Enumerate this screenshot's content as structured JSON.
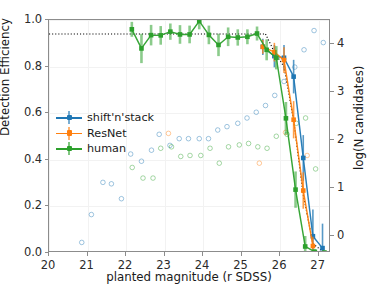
{
  "chart_data": {
    "type": "line",
    "title": "",
    "xlabel": "planted magnitude (r SDSS)",
    "ylabel": "Detection Efficiency",
    "y2label": "log(N candidates)",
    "xlim": [
      20,
      27.32
    ],
    "ylim": [
      0.0,
      1.0
    ],
    "y2lim": [
      -0.35,
      4.5
    ],
    "xticks": [
      20,
      21,
      22,
      23,
      24,
      25,
      26,
      27
    ],
    "xticklabels": [
      "20",
      "21",
      "22",
      "23",
      "24",
      "25",
      "26",
      "27"
    ],
    "yticks": [
      0.0,
      0.2,
      0.4,
      0.6,
      0.8,
      1.0
    ],
    "yticklabels": [
      "0.0",
      "0.2",
      "0.4",
      "0.6",
      "0.8",
      "1.0"
    ],
    "y2ticks": [
      0,
      1,
      2,
      3,
      4
    ],
    "y2ticklabels": [
      "0",
      "1",
      "2",
      "3",
      "4"
    ],
    "grid": true,
    "legend_position": "center-left",
    "reference_line": {
      "label": "max efficiency",
      "value": 0.94,
      "style": "dotted",
      "color": "#000000"
    },
    "series": [
      {
        "name": "shift'n'stack",
        "color": "#1f77b4",
        "marker": "square",
        "x": [
          25.55,
          25.85,
          26.1,
          26.35,
          26.6,
          26.85,
          27.1
        ],
        "values": [
          0.885,
          0.845,
          0.838,
          0.757,
          0.408,
          0.072,
          0.021
        ],
        "yerr": [
          0.035,
          0.048,
          0.055,
          0.072,
          0.098,
          0.115,
          0.105
        ]
      },
      {
        "name": "ResNet",
        "color": "#ff7f0e",
        "marker": "square",
        "x": [
          25.55,
          25.85,
          26.1,
          26.35,
          26.6,
          26.85
        ],
        "values": [
          0.885,
          0.862,
          0.828,
          0.572,
          0.268,
          0.03
        ],
        "yerr": [
          0.03,
          0.04,
          0.055,
          0.08,
          0.078,
          0.04
        ]
      },
      {
        "name": "human",
        "color": "#2ca02c",
        "marker": "square",
        "x": [
          22.15,
          22.4,
          22.65,
          22.9,
          23.15,
          23.4,
          23.65,
          23.9,
          24.15,
          24.4,
          24.65,
          24.9,
          25.15,
          25.4,
          25.65,
          25.9,
          26.15,
          26.4,
          26.65,
          26.9,
          27.15
        ],
        "values": [
          0.96,
          0.878,
          0.935,
          0.934,
          0.95,
          0.938,
          0.938,
          0.995,
          0.936,
          0.893,
          0.928,
          0.925,
          0.928,
          0.942,
          0.872,
          0.838,
          0.578,
          0.272,
          0.028,
          0.005,
          0.002
        ],
        "yerr": [
          0.032,
          0.063,
          0.044,
          0.04,
          0.035,
          0.04,
          0.038,
          0.035,
          0.04,
          0.048,
          0.04,
          0.035,
          0.032,
          0.03,
          0.045,
          0.05,
          0.07,
          0.078,
          0.045,
          0.012,
          0.008
        ]
      }
    ],
    "candidate_counts": {
      "description": "log(N candidates) open markers (right axis)",
      "points": [
        {
          "x": 20.85,
          "y2": -0.13,
          "color": "#1f77b4"
        },
        {
          "x": 21.1,
          "y2": 0.45,
          "color": "#1f77b4"
        },
        {
          "x": 21.4,
          "y2": 1.12,
          "color": "#1f77b4"
        },
        {
          "x": 21.62,
          "y2": 1.09,
          "color": "#1f77b4"
        },
        {
          "x": 21.88,
          "y2": 0.78,
          "color": "#1f77b4"
        },
        {
          "x": 22.12,
          "y2": 1.71,
          "color": "#1f77b4"
        },
        {
          "x": 22.16,
          "y2": 1.43,
          "color": "#2ca02c"
        },
        {
          "x": 22.4,
          "y2": 1.56,
          "color": "#1f77b4"
        },
        {
          "x": 22.44,
          "y2": 1.21,
          "color": "#2ca02c"
        },
        {
          "x": 22.66,
          "y2": 1.79,
          "color": "#1f77b4"
        },
        {
          "x": 22.7,
          "y2": 1.21,
          "color": "#2ca02c"
        },
        {
          "x": 22.86,
          "y2": 2.12,
          "color": "#1f77b4"
        },
        {
          "x": 22.9,
          "y2": 1.83,
          "color": "#2ca02c"
        },
        {
          "x": 23.1,
          "y2": 2.14,
          "color": "#ff7f0e"
        },
        {
          "x": 23.14,
          "y2": 1.89,
          "color": "#1f77b4"
        },
        {
          "x": 23.18,
          "y2": 1.86,
          "color": "#2ca02c"
        },
        {
          "x": 23.38,
          "y2": 2.03,
          "color": "#1f77b4"
        },
        {
          "x": 23.42,
          "y2": 1.66,
          "color": "#2ca02c"
        },
        {
          "x": 23.62,
          "y2": 2.03,
          "color": "#1f77b4"
        },
        {
          "x": 23.66,
          "y2": 1.68,
          "color": "#2ca02c"
        },
        {
          "x": 23.9,
          "y2": 2.03,
          "color": "#1f77b4"
        },
        {
          "x": 23.94,
          "y2": 1.68,
          "color": "#2ca02c"
        },
        {
          "x": 24.14,
          "y2": 2.03,
          "color": "#1f77b4"
        },
        {
          "x": 24.18,
          "y2": 1.83,
          "color": "#2ca02c"
        },
        {
          "x": 24.38,
          "y2": 2.21,
          "color": "#1f77b4"
        },
        {
          "x": 24.42,
          "y2": 1.52,
          "color": "#2ca02c"
        },
        {
          "x": 24.62,
          "y2": 2.28,
          "color": "#1f77b4"
        },
        {
          "x": 24.66,
          "y2": 1.86,
          "color": "#2ca02c"
        },
        {
          "x": 24.9,
          "y2": 2.35,
          "color": "#1f77b4"
        },
        {
          "x": 24.94,
          "y2": 1.9,
          "color": "#2ca02c"
        },
        {
          "x": 25.14,
          "y2": 2.46,
          "color": "#1f77b4"
        },
        {
          "x": 25.18,
          "y2": 1.93,
          "color": "#2ca02c"
        },
        {
          "x": 25.38,
          "y2": 2.58,
          "color": "#1f77b4"
        },
        {
          "x": 25.42,
          "y2": 1.86,
          "color": "#2ca02c"
        },
        {
          "x": 25.46,
          "y2": 1.52,
          "color": "#ff7f0e"
        },
        {
          "x": 25.62,
          "y2": 2.72,
          "color": "#1f77b4"
        },
        {
          "x": 25.66,
          "y2": 1.83,
          "color": "#2ca02c"
        },
        {
          "x": 25.86,
          "y2": 2.93,
          "color": "#1f77b4"
        },
        {
          "x": 25.9,
          "y2": 2.08,
          "color": "#2ca02c"
        },
        {
          "x": 26.1,
          "y2": 3.22,
          "color": "#1f77b4"
        },
        {
          "x": 26.14,
          "y2": 2.16,
          "color": "#ff7f0e"
        },
        {
          "x": 26.18,
          "y2": 2.12,
          "color": "#2ca02c"
        },
        {
          "x": 26.38,
          "y2": 3.52,
          "color": "#1f77b4"
        },
        {
          "x": 26.42,
          "y2": 2.35,
          "color": "#2ca02c"
        },
        {
          "x": 26.62,
          "y2": 3.88,
          "color": "#1f77b4"
        },
        {
          "x": 26.66,
          "y2": 2.46,
          "color": "#2ca02c"
        },
        {
          "x": 26.7,
          "y2": 1.68,
          "color": "#ff7f0e"
        },
        {
          "x": 26.88,
          "y2": 4.28,
          "color": "#1f77b4"
        },
        {
          "x": 26.92,
          "y2": 1.4,
          "color": "#2ca02c"
        },
        {
          "x": 27.12,
          "y2": 4.03,
          "color": "#1f77b4"
        }
      ]
    }
  },
  "legend": {
    "entries": [
      {
        "label": "shift'n'stack",
        "color": "#1f77b4"
      },
      {
        "label": "ResNet",
        "color": "#ff7f0e"
      },
      {
        "label": "human",
        "color": "#2ca02c"
      }
    ]
  }
}
